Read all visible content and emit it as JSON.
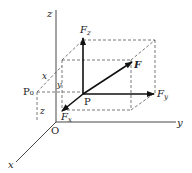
{
  "diagram": {
    "type": "3d-force-decomposition",
    "axes": {
      "x_label": "x",
      "y_label": "y",
      "z_label": "z",
      "origin_label": "O"
    },
    "points": {
      "P": "P",
      "P0": "P₀"
    },
    "vectors": {
      "F": "F",
      "Fx": "F",
      "Fx_sub": "x",
      "Fy": "F",
      "Fy_sub": "y",
      "Fz": "F",
      "Fz_sub": "z"
    },
    "coordinate_labels": {
      "x": "x",
      "y": "y",
      "z": "z"
    },
    "colors": {
      "line": "#222222",
      "dashed": "#555555",
      "background": "#ffffff"
    }
  }
}
